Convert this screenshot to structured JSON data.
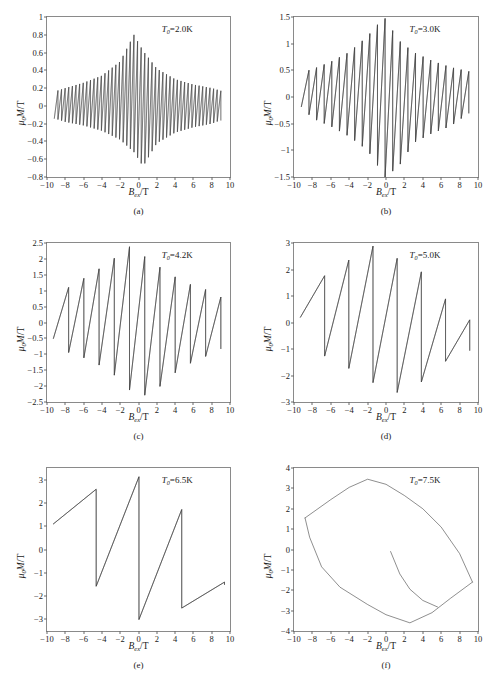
{
  "figure": {
    "axis_label_x": "Bex/T",
    "axis_label_y": "u0M/T",
    "line_color": "#3d3d3d",
    "axis_color": "#8a8a8a",
    "background": "#ffffff"
  },
  "panels": [
    {
      "caption": "(a)",
      "annotation": "T0=2.0K",
      "temperature": "2.0",
      "xlabel": "Bex/T",
      "ylabel": "u0M/T",
      "yticks": [
        1,
        0.8,
        0.6,
        0.4,
        0.2,
        0,
        -0.2,
        -0.4,
        -0.6,
        -0.8
      ],
      "ytick_labels": [
        "1",
        "0.8",
        "0.6",
        "0.4",
        "0.2",
        "0",
        "-0.2",
        "-0.4",
        "-0.6",
        "-0.8"
      ],
      "xticks": [
        -10,
        -8,
        -6,
        -4,
        -2,
        0,
        2,
        4,
        6,
        8,
        10
      ],
      "xtick_labels": [
        "-10",
        "-8",
        "-6",
        "-4",
        "-2",
        "0",
        "2",
        "4",
        "6",
        "8",
        "10"
      ],
      "xlim": [
        -10,
        10
      ],
      "ylim": [
        -0.8,
        1.0
      ],
      "n_oscillations": 46,
      "peak_amplitude": 0.8,
      "data_xmin": -9.2,
      "data_xmax": 9.0
    },
    {
      "caption": "(b)",
      "annotation": "T0=3.0K",
      "temperature": "3.0",
      "xlabel": "Bex/T",
      "ylabel": "u0M/T",
      "yticks": [
        1.5,
        1,
        0.5,
        0,
        -0.5,
        -1,
        -1.5
      ],
      "ytick_labels": [
        "1.5",
        "1",
        "0.5",
        "0",
        "-0.5",
        "-1",
        "-1.5"
      ],
      "xticks": [
        -10,
        -8,
        -6,
        -4,
        -2,
        0,
        2,
        4,
        6,
        8,
        10
      ],
      "xtick_labels": [
        "-10",
        "-8",
        "-6",
        "-4",
        "-2",
        "0",
        "2",
        "4",
        "6",
        "8",
        "10"
      ],
      "xlim": [
        -10,
        10
      ],
      "ylim": [
        -1.5,
        1.5
      ],
      "n_oscillations": 22,
      "peak_amplitude": 1.5,
      "data_xmin": -9.2,
      "data_xmax": 9.0
    },
    {
      "caption": "(c)",
      "annotation": "T0=4.2K",
      "temperature": "4.2",
      "xlabel": "Bex/T",
      "ylabel": "u0M/T",
      "yticks": [
        2.5,
        2,
        1.5,
        1,
        0.5,
        0,
        -0.5,
        -1,
        -1.5,
        -2,
        -2.5
      ],
      "ytick_labels": [
        "2.5",
        "2",
        "1.5",
        "1",
        "0.5",
        "0",
        "-0.5",
        "-1",
        "-1.5",
        "-2",
        "-2.5"
      ],
      "xticks": [
        -10,
        -8,
        -6,
        -4,
        -2,
        0,
        2,
        4,
        6,
        8,
        10
      ],
      "xtick_labels": [
        "-10",
        "-8",
        "-6",
        "-4",
        "-2",
        "0",
        "2",
        "4",
        "6",
        "8",
        "10"
      ],
      "xlim": [
        -10,
        10
      ],
      "ylim": [
        -2.5,
        2.5
      ],
      "n_oscillations": 11,
      "peak_amplitude": 2.4,
      "data_xmin": -9.3,
      "data_xmax": 9.0
    },
    {
      "caption": "(d)",
      "annotation": "T0=5.0K",
      "temperature": "5.0",
      "xlabel": "Bex/T",
      "ylabel": "u0M/T",
      "yticks": [
        3,
        2,
        1,
        0,
        -1,
        -2,
        -3
      ],
      "ytick_labels": [
        "3",
        "2",
        "1",
        "0",
        "-1",
        "-2",
        "-3"
      ],
      "xticks": [
        -10,
        -8,
        -6,
        -4,
        -2,
        0,
        2,
        4,
        6,
        8,
        10
      ],
      "xtick_labels": [
        "-10",
        "-8",
        "-6",
        "-4",
        "-2",
        "0",
        "2",
        "4",
        "6",
        "8",
        "10"
      ],
      "xlim": [
        -10,
        10
      ],
      "ylim": [
        -3,
        3
      ],
      "n_oscillations": 7,
      "peak_amplitude": 2.95,
      "data_xmin": -9.3,
      "data_xmax": 9.1
    },
    {
      "caption": "(e)",
      "annotation": "T0=6.5K",
      "temperature": "6.5",
      "xlabel": "Bex/T",
      "ylabel": "u0M/T",
      "yticks": [
        3,
        2,
        1,
        0,
        -1,
        -2,
        -3
      ],
      "ytick_labels": [
        "3",
        "2",
        "1",
        "0",
        "-1",
        "-2",
        "-3"
      ],
      "xticks": [
        -10,
        -8,
        -6,
        -4,
        -2,
        0,
        2,
        4,
        6,
        8,
        10
      ],
      "xtick_labels": [
        "-10",
        "-8",
        "-6",
        "-4",
        "-2",
        "0",
        "2",
        "4",
        "6",
        "8",
        "10"
      ],
      "xlim": [
        -10,
        10
      ],
      "ylim": [
        -3.5,
        3.5
      ],
      "n_oscillations": 4,
      "peak_amplitude": 3.3,
      "data_xmin": -9.3,
      "data_xmax": 9.4
    },
    {
      "caption": "(f)",
      "annotation": "T0=7.5K",
      "temperature": "7.5",
      "xlabel": "Bex/T",
      "ylabel": "u0M/T",
      "yticks": [
        4,
        3,
        2,
        1,
        0,
        -1,
        -2,
        -3,
        -4
      ],
      "ytick_labels": [
        "4",
        "3",
        "2",
        "1",
        "0",
        "-1",
        "-2",
        "-3",
        "-4"
      ],
      "xticks": [
        -10,
        -8,
        -6,
        -4,
        -2,
        0,
        2,
        4,
        6,
        8,
        10
      ],
      "xtick_labels": [
        "-10",
        "-8",
        "-6",
        "-4",
        "-2",
        "0",
        "2",
        "4",
        "6",
        "8",
        "10"
      ],
      "xlim": [
        -10,
        10
      ],
      "ylim": [
        -4,
        4
      ],
      "n_oscillations": 1,
      "peak_amplitude": 3.5,
      "data_xmin": -8.8,
      "data_xmax": 9.4
    }
  ],
  "chart_data": {
    "type": "line",
    "title": "",
    "xlabel": "Bex/T",
    "ylabel": "u0M/T",
    "grid": false,
    "legend": "none",
    "subplots": [
      {
        "id": "a",
        "caption": "(a)",
        "annotation": "T0=2.0K",
        "xlim": [
          -10,
          10
        ],
        "ylim": [
          -0.8,
          1.0
        ],
        "xticks": [
          -10,
          -8,
          -6,
          -4,
          -2,
          0,
          2,
          4,
          6,
          8,
          10
        ],
        "yticks": [
          -0.8,
          -0.6,
          -0.4,
          -0.2,
          0,
          0.2,
          0.4,
          0.6,
          0.8,
          1
        ],
        "description": "Dense sawtooth de Haas-van Alphen oscillations, ~46 periods, envelope peaks at center",
        "envelope_max": [
          {
            "x": -9.2,
            "y": 0.16
          },
          {
            "x": -8.0,
            "y": 0.2
          },
          {
            "x": -6.0,
            "y": 0.26
          },
          {
            "x": -4.0,
            "y": 0.34
          },
          {
            "x": -2.0,
            "y": 0.5
          },
          {
            "x": -0.5,
            "y": 0.8
          },
          {
            "x": 0.5,
            "y": 0.62
          },
          {
            "x": 2.0,
            "y": 0.42
          },
          {
            "x": 4.0,
            "y": 0.3
          },
          {
            "x": 6.0,
            "y": 0.24
          },
          {
            "x": 8.0,
            "y": 0.2
          },
          {
            "x": 9.0,
            "y": 0.17
          }
        ],
        "envelope_min": [
          {
            "x": -9.2,
            "y": -0.14
          },
          {
            "x": -8.0,
            "y": -0.18
          },
          {
            "x": -6.0,
            "y": -0.22
          },
          {
            "x": -4.0,
            "y": -0.28
          },
          {
            "x": -2.0,
            "y": -0.38
          },
          {
            "x": -0.5,
            "y": -0.52
          },
          {
            "x": 0.5,
            "y": -0.68
          },
          {
            "x": 2.0,
            "y": -0.42
          },
          {
            "x": 4.0,
            "y": -0.3
          },
          {
            "x": 6.0,
            "y": -0.24
          },
          {
            "x": 8.0,
            "y": -0.2
          },
          {
            "x": 9.0,
            "y": -0.16
          }
        ]
      },
      {
        "id": "b",
        "caption": "(b)",
        "annotation": "T0=3.0K",
        "xlim": [
          -10,
          10
        ],
        "ylim": [
          -1.5,
          1.5
        ],
        "xticks": [
          -10,
          -8,
          -6,
          -4,
          -2,
          0,
          2,
          4,
          6,
          8,
          10
        ],
        "yticks": [
          -1.5,
          -1,
          -0.5,
          0,
          0.5,
          1,
          1.5
        ],
        "description": "Sawtooth oscillations, ~22 periods, amplitude grows toward B=0",
        "envelope_max": [
          {
            "x": -9.2,
            "y": 0.46
          },
          {
            "x": -8.0,
            "y": 0.52
          },
          {
            "x": -6.0,
            "y": 0.66
          },
          {
            "x": -4.0,
            "y": 0.84
          },
          {
            "x": -2.0,
            "y": 1.14
          },
          {
            "x": -0.2,
            "y": 1.5
          },
          {
            "x": 1.4,
            "y": 1.06
          },
          {
            "x": 3.0,
            "y": 0.84
          },
          {
            "x": 5.0,
            "y": 0.68
          },
          {
            "x": 7.0,
            "y": 0.56
          },
          {
            "x": 9.0,
            "y": 0.48
          }
        ],
        "envelope_min": [
          {
            "x": -9.2,
            "y": -0.18
          },
          {
            "x": -8.0,
            "y": -0.4
          },
          {
            "x": -6.0,
            "y": -0.55
          },
          {
            "x": -4.0,
            "y": -0.74
          },
          {
            "x": -2.0,
            "y": -1.0
          },
          {
            "x": -0.1,
            "y": -1.5
          },
          {
            "x": 1.4,
            "y": -1.3
          },
          {
            "x": 3.0,
            "y": -0.86
          },
          {
            "x": 5.0,
            "y": -0.68
          },
          {
            "x": 7.0,
            "y": -0.55
          },
          {
            "x": 9.0,
            "y": -0.3
          }
        ]
      },
      {
        "id": "c",
        "caption": "(c)",
        "annotation": "T0=4.2K",
        "xlim": [
          -10,
          10
        ],
        "ylim": [
          -2.5,
          2.5
        ],
        "xticks": [
          -10,
          -8,
          -6,
          -4,
          -2,
          0,
          2,
          4,
          6,
          8,
          10
        ],
        "yticks": [
          -2.5,
          -2,
          -1.5,
          -1,
          -0.5,
          0,
          0.5,
          1,
          1.5,
          2,
          2.5
        ],
        "description": "Sawtooth oscillations, ~11 periods, peak 2.4 near B=-1",
        "envelope_max": [
          {
            "x": -9.3,
            "y": 0.74
          },
          {
            "x": -8.2,
            "y": 1.0
          },
          {
            "x": -6.9,
            "y": 1.24
          },
          {
            "x": -5.4,
            "y": 1.48
          },
          {
            "x": -3.2,
            "y": 1.9
          },
          {
            "x": -0.9,
            "y": 2.4
          },
          {
            "x": 1.9,
            "y": 1.82
          },
          {
            "x": 4.2,
            "y": 1.4
          },
          {
            "x": 6.1,
            "y": 1.14
          },
          {
            "x": 7.8,
            "y": 1.0
          },
          {
            "x": 9.0,
            "y": 0.8
          }
        ],
        "envelope_min": [
          {
            "x": -9.3,
            "y": -0.5
          },
          {
            "x": -8.2,
            "y": -0.9
          },
          {
            "x": -6.9,
            "y": -1.0
          },
          {
            "x": -5.4,
            "y": -1.18
          },
          {
            "x": -3.2,
            "y": -1.5
          },
          {
            "x": 0.0,
            "y": -2.4
          },
          {
            "x": 2.4,
            "y": -2.0
          },
          {
            "x": 4.4,
            "y": -1.48
          },
          {
            "x": 6.2,
            "y": -1.2
          },
          {
            "x": 7.9,
            "y": -1.0
          },
          {
            "x": 9.0,
            "y": -0.82
          }
        ]
      },
      {
        "id": "d",
        "caption": "(d)",
        "annotation": "T0=5.0K",
        "xlim": [
          -10,
          10
        ],
        "ylim": [
          -3,
          3
        ],
        "xticks": [
          -10,
          -8,
          -6,
          -4,
          -2,
          0,
          2,
          4,
          6,
          8,
          10
        ],
        "yticks": [
          -3,
          -2,
          -1,
          0,
          1,
          2,
          3
        ],
        "description": "Large sawtooth jumps, ~7 periods, peak 2.95 at B=-1.8",
        "envelope_max": [
          {
            "x": -9.3,
            "y": 1.26
          },
          {
            "x": -7.3,
            "y": 1.64
          },
          {
            "x": -5.0,
            "y": 2.1
          },
          {
            "x": -1.8,
            "y": 2.95
          },
          {
            "x": 1.9,
            "y": 2.3
          },
          {
            "x": 5.0,
            "y": 1.68
          },
          {
            "x": 7.2,
            "y": 0.5
          },
          {
            "x": 9.1,
            "y": 0.1
          }
        ],
        "envelope_min": [
          {
            "x": -9.3,
            "y": 0.2
          },
          {
            "x": -7.8,
            "y": -1.1
          },
          {
            "x": -5.1,
            "y": -1.5
          },
          {
            "x": -1.9,
            "y": -2.2
          },
          {
            "x": 2.0,
            "y": -2.75
          },
          {
            "x": 5.1,
            "y": -1.9
          },
          {
            "x": 7.3,
            "y": -1.2
          },
          {
            "x": 9.1,
            "y": -1.05
          }
        ]
      },
      {
        "id": "e",
        "caption": "(e)",
        "annotation": "T0=6.5K",
        "xlim": [
          -10,
          10
        ],
        "ylim": [
          -3.5,
          3.5
        ],
        "xticks": [
          -10,
          -8,
          -6,
          -4,
          -2,
          0,
          2,
          4,
          6,
          8,
          10
        ],
        "yticks": [
          -3,
          -2,
          -1,
          0,
          1,
          2,
          3
        ],
        "description": "Few large jumps forming open hysteresis loop, peak 3.3 at B=-0.7",
        "envelope_max": [
          {
            "x": -9.3,
            "y": 1.42
          },
          {
            "x": -8.0,
            "y": 1.6
          },
          {
            "x": -5.0,
            "y": 2.52
          },
          {
            "x": -0.7,
            "y": 3.3
          },
          {
            "x": 4.0,
            "y": 2.2
          },
          {
            "x": 9.4,
            "y": -1.4
          }
        ],
        "envelope_min": [
          {
            "x": -9.3,
            "y": 1.1
          },
          {
            "x": -6.0,
            "y": -1.2
          },
          {
            "x": -2.0,
            "y": -2.3
          },
          {
            "x": 0.9,
            "y": -3.3
          },
          {
            "x": 4.8,
            "y": -2.5
          },
          {
            "x": 9.4,
            "y": -1.5
          }
        ]
      },
      {
        "id": "f",
        "caption": "(f)",
        "annotation": "T0=7.5K",
        "xlim": [
          -10,
          10
        ],
        "ylim": [
          -4,
          4
        ],
        "xticks": [
          -10,
          -8,
          -6,
          -4,
          -2,
          0,
          2,
          4,
          6,
          8,
          10
        ],
        "yticks": [
          -4,
          -3,
          -2,
          -1,
          0,
          1,
          2,
          3,
          4
        ],
        "description": "Single smooth closed hysteresis loop, no sawtooth jumps; inner virgin curve from (0.5,-0.1) to (5.6,-2.8)",
        "upper_branch": [
          {
            "x": -8.8,
            "y": 1.55
          },
          {
            "x": -6.0,
            "y": 2.45
          },
          {
            "x": -4.0,
            "y": 3.05
          },
          {
            "x": -2.0,
            "y": 3.45
          },
          {
            "x": 0.0,
            "y": 3.2
          },
          {
            "x": 2.0,
            "y": 2.65
          },
          {
            "x": 4.0,
            "y": 2.0
          },
          {
            "x": 6.0,
            "y": 1.1
          },
          {
            "x": 8.0,
            "y": -0.2
          },
          {
            "x": 9.4,
            "y": -1.6
          }
        ],
        "lower_branch": [
          {
            "x": -8.8,
            "y": 1.55
          },
          {
            "x": -8.3,
            "y": 0.6
          },
          {
            "x": -7.0,
            "y": -0.85
          },
          {
            "x": -5.0,
            "y": -1.85
          },
          {
            "x": -2.0,
            "y": -2.7
          },
          {
            "x": 0.0,
            "y": -3.2
          },
          {
            "x": 2.6,
            "y": -3.6
          },
          {
            "x": 5.0,
            "y": -3.1
          },
          {
            "x": 7.0,
            "y": -2.4
          },
          {
            "x": 9.4,
            "y": -1.6
          }
        ],
        "virgin_curve": [
          {
            "x": 0.5,
            "y": -0.1
          },
          {
            "x": 1.5,
            "y": -1.2
          },
          {
            "x": 2.6,
            "y": -1.95
          },
          {
            "x": 4.0,
            "y": -2.5
          },
          {
            "x": 5.6,
            "y": -2.82
          }
        ]
      }
    ]
  }
}
